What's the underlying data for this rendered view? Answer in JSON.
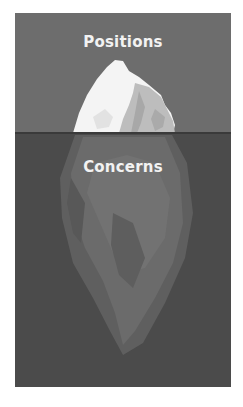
{
  "figure": {
    "above_water_label": "Positions",
    "below_water_label": "Concerns",
    "colors": {
      "sky": "#6d6d6d",
      "water": "#4b4b4b",
      "waterline": "#3a3a3a",
      "tip_light": "#f4f4f4",
      "tip_shadow": "#bdbdbd",
      "submerged_light": "#7a7a7a",
      "submerged_mid": "#6a6a6a",
      "submerged_dark": "#5c5c5c",
      "label": "#f2f2f2"
    }
  }
}
